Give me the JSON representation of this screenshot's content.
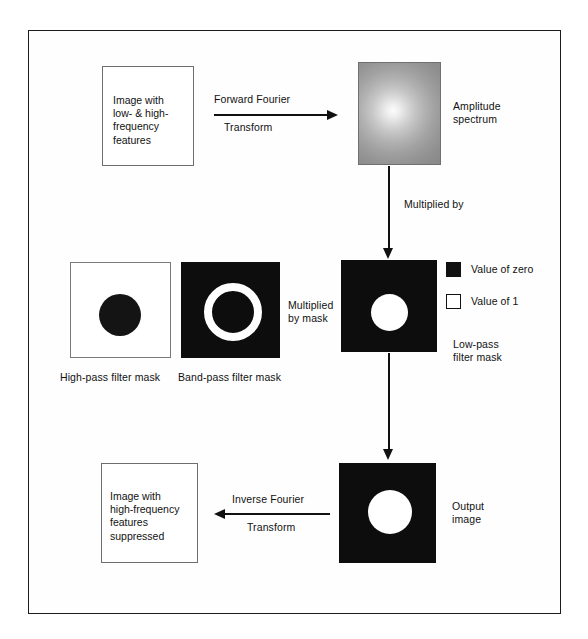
{
  "figure": {
    "frame_border_color": "#1c1c1c",
    "background": "#ffffff"
  },
  "boxes": {
    "input_image": {
      "label": "Image with\nlow- & high-\nfrequency\nfeatures"
    },
    "amplitude_spectrum": {
      "caption": "Amplitude\nspectrum"
    },
    "high_pass_mask": {
      "caption": "High-pass filter mask"
    },
    "band_pass_mask": {
      "caption": "Band-pass filter mask"
    },
    "low_pass_mask": {
      "caption": "Low-pass\nfilter mask"
    },
    "output_image": {
      "caption": "Output\nimage"
    },
    "result_image": {
      "label": "Image with\nhigh-frequency\nfeatures\nsuppressed"
    }
  },
  "arrows": {
    "forward": {
      "label_top": "Forward Fourier",
      "label_bottom": "Transform",
      "direction": "right"
    },
    "multiplied_by": {
      "label": "Multiplied by",
      "direction": "down"
    },
    "multiplied_by_mask": {
      "label": "Multiplied\nby mask",
      "direction": "none"
    },
    "to_output": {
      "direction": "down"
    },
    "inverse": {
      "label_top": "Inverse Fourier",
      "label_bottom": "Transform",
      "direction": "left"
    }
  },
  "legend": {
    "items": [
      {
        "swatch": "black",
        "label": "Value of zero",
        "color": "#111111"
      },
      {
        "swatch": "white",
        "label": "Value of 1",
        "color": "#ffffff"
      }
    ]
  }
}
